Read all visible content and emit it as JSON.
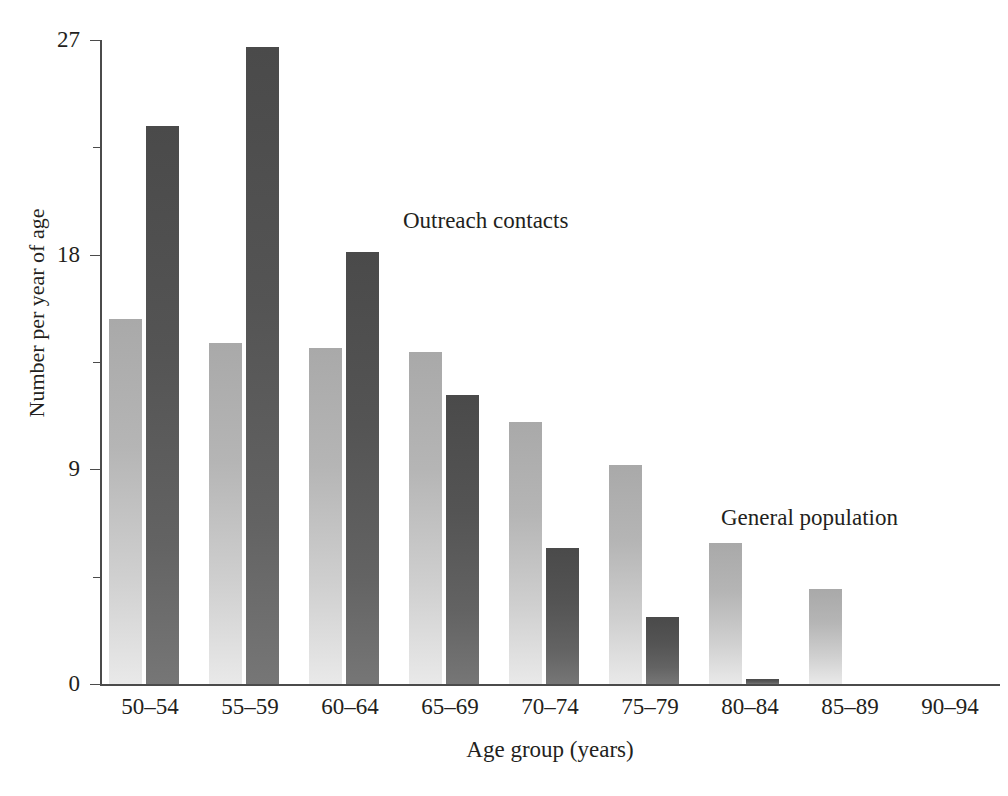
{
  "chart_data": {
    "type": "bar",
    "title": "",
    "xlabel": "Age group (years)",
    "ylabel": "Number per year of age",
    "categories": [
      "50–54",
      "55–59",
      "60–64",
      "65–69",
      "70–74",
      "75–79",
      "80–84",
      "85–89",
      "90–94"
    ],
    "series": [
      {
        "name": "General population",
        "color": "#b9b9b9",
        "values": [
          15.3,
          14.3,
          14.1,
          13.9,
          11.0,
          9.2,
          5.9,
          4.0,
          0
        ]
      },
      {
        "name": "Outreach contacts",
        "color": "#595959",
        "values": [
          23.4,
          26.7,
          18.1,
          12.1,
          5.7,
          2.8,
          0.2,
          0,
          0
        ]
      }
    ],
    "ylim": [
      0,
      27
    ],
    "yticks": [
      0,
      9,
      18,
      27
    ],
    "ytick_labels": [
      "0",
      "9",
      "18",
      "27"
    ],
    "minor_yticks": [
      4.5,
      13.5,
      22.5
    ],
    "grid": false,
    "legend": "annotations-in-plot",
    "annotations": [
      {
        "text": "Outreach contacts",
        "x_px": 403,
        "y_px": 208
      },
      {
        "text": "General population",
        "x_px": 721,
        "y_px": 505
      }
    ]
  },
  "axis": {
    "y_title": "Number per year of age",
    "x_title": "Age group (years)",
    "y_tick_labels": [
      "27",
      "18",
      "9",
      "0"
    ],
    "x_tick_labels": [
      "50–54",
      "55–59",
      "60–64",
      "65–69",
      "70–74",
      "75–79",
      "80–84",
      "85–89",
      "90–94"
    ]
  },
  "annotations": {
    "outreach": "Outreach contacts",
    "general": "General population"
  },
  "colors": {
    "light_bar": "#b9b9b9",
    "dark_bar": "#595959",
    "axis": "#4b4b4b",
    "text": "#231f20",
    "background": "#ffffff"
  }
}
